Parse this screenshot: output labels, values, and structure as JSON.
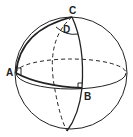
{
  "diagram": {
    "labels": {
      "A": "A",
      "B": "B",
      "C": "C",
      "D": "D"
    },
    "colors": {
      "stroke": "#222222",
      "background": "#ffffff"
    },
    "elements": [
      "sphere-outline",
      "equator-front-solid",
      "equator-back-dashed",
      "meridian-front-solid-through-C-and-B",
      "meridian-back-dashed-through-C",
      "thick-arc-A-to-C",
      "thick-arc-A-to-B",
      "angle-arc-D-at-C",
      "right-angle-marker-A",
      "right-angle-marker-B"
    ]
  }
}
